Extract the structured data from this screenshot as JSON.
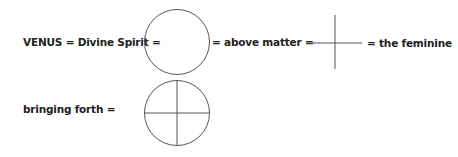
{
  "row1": {
    "venus_label": "VENUS = Divine Spirit =",
    "above_matter_label": "= above matter =",
    "feminine_label": "= the feminine"
  },
  "row2": {
    "bringing_forth_label": "bringing forth ="
  },
  "symbols": {
    "circle": "circle-symbol",
    "cross": "cross-symbol",
    "venus_circle_cross": "circled-cross-symbol"
  },
  "colors": {
    "stroke": "#555555",
    "text": "#222222"
  }
}
